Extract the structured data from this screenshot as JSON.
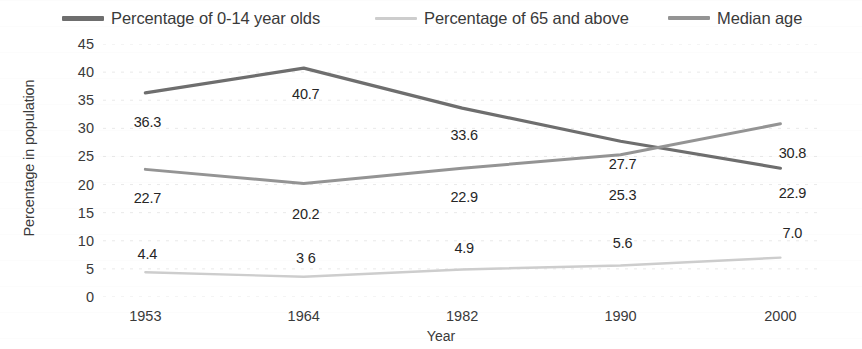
{
  "chart_data": {
    "type": "line",
    "title": "",
    "xlabel": "Year",
    "ylabel": "Percentage in population",
    "categories": [
      "1953",
      "1964",
      "1982",
      "1990",
      "2000"
    ],
    "ylim": [
      0,
      45
    ],
    "ytick_step": 5,
    "yticks": [
      "45",
      "40",
      "35",
      "30",
      "25",
      "20",
      "15",
      "10",
      "5",
      "0"
    ],
    "grid": true,
    "grid_axis": "y",
    "legend_position": "top",
    "series": [
      {
        "name": "Percentage of 0-14 year olds",
        "color": "#6e6e6e",
        "values": [
          36.3,
          40.7,
          33.6,
          27.7,
          22.9
        ],
        "labels": [
          "36.3",
          "40.7",
          "33.6",
          "27.7",
          "22.9"
        ]
      },
      {
        "name": "Percentage of 65 and above",
        "color": "#cdcdcd",
        "values": [
          4.4,
          3.6,
          4.9,
          5.6,
          7.0
        ],
        "labels": [
          "4.4",
          "3 6",
          "4.9",
          "5.6",
          "7.0"
        ]
      },
      {
        "name": "Median age",
        "color": "#949494",
        "values": [
          22.7,
          20.2,
          22.9,
          25.3,
          30.8
        ],
        "labels": [
          "22.7",
          "20.2",
          "22.9",
          "25.3",
          "30.8"
        ]
      }
    ]
  },
  "legend": {
    "items": [
      {
        "label": "Percentage of 0-14 year olds",
        "color": "#6e6e6e"
      },
      {
        "label": "Percentage of 65 and above",
        "color": "#cdcdcd"
      },
      {
        "label": "Median age",
        "color": "#949494"
      }
    ]
  },
  "axes": {
    "y_title": "Percentage in population",
    "x_title": "Year"
  }
}
